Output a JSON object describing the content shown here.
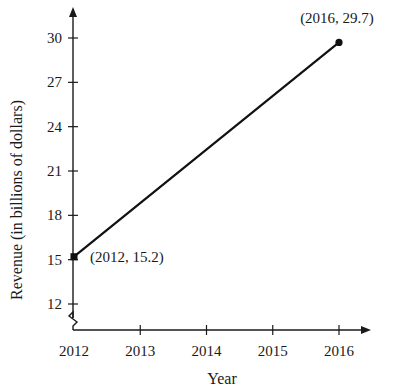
{
  "chart_data": {
    "type": "line",
    "title": "",
    "xlabel": "Year",
    "ylabel": "Revenue (in billions of dollars)",
    "x": [
      2012,
      2016
    ],
    "values": [
      15.2,
      29.7
    ],
    "series": [
      {
        "name": "Revenue",
        "x": [
          2012,
          2016
        ],
        "values": [
          15.2,
          29.7
        ]
      }
    ],
    "xticks": [
      "2012",
      "2013",
      "2014",
      "2015",
      "2016"
    ],
    "yticks": [
      "12",
      "15",
      "18",
      "21",
      "24",
      "27",
      "30"
    ],
    "xlim": [
      2012,
      2016
    ],
    "ylim": [
      12,
      30
    ],
    "y_axis_break": true,
    "grid": false,
    "legend": "none",
    "annotations": [
      {
        "text": "(2012, 15.2)",
        "x": 2012,
        "y": 15.2
      },
      {
        "text": "(2016, 29.7)",
        "x": 2016,
        "y": 29.7
      }
    ]
  },
  "colors": {
    "line": "#111111",
    "axis": "#1a1a1a",
    "background": "#ffffff"
  }
}
